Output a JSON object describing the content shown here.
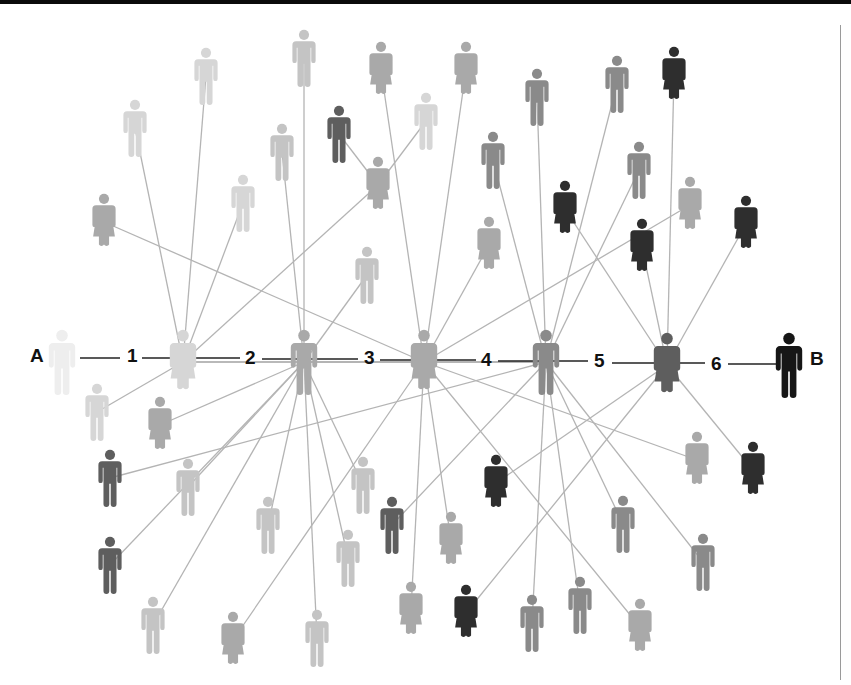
{
  "chain": {
    "start_label": "A",
    "end_label": "B",
    "steps": [
      "1",
      "2",
      "3",
      "4",
      "5",
      "6"
    ]
  },
  "colors": {
    "line": "#b4b4b4",
    "chain_line": "#222222",
    "shades": {
      "0": "#eeeeee",
      "1": "#d6d6d6",
      "2": "#c4c4c4",
      "3": "#a9a9a9",
      "4": "#8a8a8a",
      "5": "#5e5e5e",
      "6": "#2e2e2e",
      "7": "#161616"
    }
  },
  "hubs": [
    {
      "id": "A",
      "x": 62,
      "y": 362,
      "g": "m",
      "shade": "0"
    },
    {
      "id": "H1",
      "x": 183,
      "y": 362,
      "g": "f",
      "shade": "1"
    },
    {
      "id": "H2",
      "x": 304,
      "y": 362,
      "g": "m",
      "shade": "3"
    },
    {
      "id": "H3",
      "x": 424,
      "y": 362,
      "g": "f",
      "shade": "3"
    },
    {
      "id": "H4",
      "x": 546,
      "y": 362,
      "g": "m",
      "shade": "4"
    },
    {
      "id": "H5",
      "x": 667,
      "y": 365,
      "g": "f",
      "shade": "5"
    },
    {
      "id": "B",
      "x": 789,
      "y": 365,
      "g": "m",
      "shade": "7"
    }
  ],
  "people": [
    {
      "x": 206,
      "y": 76,
      "g": "m",
      "shade": "1",
      "to": "H1"
    },
    {
      "x": 135,
      "y": 128,
      "g": "m",
      "shade": "1",
      "to": "H1"
    },
    {
      "x": 104,
      "y": 222,
      "g": "f",
      "shade": "3",
      "to": "H3"
    },
    {
      "x": 243,
      "y": 203,
      "g": "m",
      "shade": "1",
      "to": "H1"
    },
    {
      "x": 304,
      "y": 58,
      "g": "m",
      "shade": "2",
      "to": "H2"
    },
    {
      "x": 282,
      "y": 152,
      "g": "m",
      "shade": "2",
      "to": "H2"
    },
    {
      "x": 339,
      "y": 134,
      "g": "m",
      "shade": "5",
      "to": "P_mid"
    },
    {
      "x": 381,
      "y": 70,
      "g": "f",
      "shade": "3",
      "to": "H3"
    },
    {
      "x": 426,
      "y": 121,
      "g": "m",
      "shade": "1",
      "to": "P_mid"
    },
    {
      "x": 466,
      "y": 70,
      "g": "f",
      "shade": "3",
      "to": "H3"
    },
    {
      "id": "P_mid",
      "x": 378,
      "y": 185,
      "g": "f",
      "shade": "3",
      "to": "H1"
    },
    {
      "x": 367,
      "y": 275,
      "g": "m",
      "shade": "2",
      "to": "H2"
    },
    {
      "x": 537,
      "y": 97,
      "g": "m",
      "shade": "4",
      "to": "H4"
    },
    {
      "x": 493,
      "y": 160,
      "g": "m",
      "shade": "4",
      "to": "H4"
    },
    {
      "x": 489,
      "y": 245,
      "g": "f",
      "shade": "3",
      "to": "H3"
    },
    {
      "x": 617,
      "y": 84,
      "g": "m",
      "shade": "4",
      "to": "H4"
    },
    {
      "x": 674,
      "y": 75,
      "g": "f",
      "shade": "6",
      "to": "H5"
    },
    {
      "x": 565,
      "y": 209,
      "g": "f",
      "shade": "6",
      "to": "H5"
    },
    {
      "x": 639,
      "y": 170,
      "g": "m",
      "shade": "4",
      "to": "H4"
    },
    {
      "x": 642,
      "y": 247,
      "g": "f",
      "shade": "6",
      "to": "H5"
    },
    {
      "x": 690,
      "y": 205,
      "g": "f",
      "shade": "3",
      "to": "H3"
    },
    {
      "x": 746,
      "y": 224,
      "g": "f",
      "shade": "6",
      "to": "H5"
    },
    {
      "x": 97,
      "y": 412,
      "g": "m",
      "shade": "1",
      "to": "H1"
    },
    {
      "x": 160,
      "y": 425,
      "g": "f",
      "shade": "3",
      "to": "H2"
    },
    {
      "x": 110,
      "y": 478,
      "g": "m",
      "shade": "5",
      "to": "H4"
    },
    {
      "x": 188,
      "y": 487,
      "g": "m",
      "shade": "2",
      "to": "H2"
    },
    {
      "x": 110,
      "y": 565,
      "g": "m",
      "shade": "5",
      "to": "H2"
    },
    {
      "x": 268,
      "y": 525,
      "g": "m",
      "shade": "2",
      "to": "H2"
    },
    {
      "x": 363,
      "y": 485,
      "g": "m",
      "shade": "2",
      "to": "H2"
    },
    {
      "x": 348,
      "y": 558,
      "g": "m",
      "shade": "2",
      "to": "H2"
    },
    {
      "x": 153,
      "y": 625,
      "g": "m",
      "shade": "2",
      "to": "H2"
    },
    {
      "x": 233,
      "y": 640,
      "g": "f",
      "shade": "3",
      "to": "H3"
    },
    {
      "x": 317,
      "y": 638,
      "g": "m",
      "shade": "2",
      "to": "H2"
    },
    {
      "x": 392,
      "y": 525,
      "g": "m",
      "shade": "5",
      "to": "H4"
    },
    {
      "x": 451,
      "y": 540,
      "g": "f",
      "shade": "3",
      "to": "H3"
    },
    {
      "x": 496,
      "y": 483,
      "g": "f",
      "shade": "6",
      "to": "H5"
    },
    {
      "x": 411,
      "y": 610,
      "g": "f",
      "shade": "3",
      "to": "H3"
    },
    {
      "x": 466,
      "y": 613,
      "g": "f",
      "shade": "6",
      "to": "H5"
    },
    {
      "x": 532,
      "y": 623,
      "g": "m",
      "shade": "4",
      "to": "H4"
    },
    {
      "x": 580,
      "y": 605,
      "g": "m",
      "shade": "4",
      "to": "H4"
    },
    {
      "x": 623,
      "y": 524,
      "g": "m",
      "shade": "4",
      "to": "H4"
    },
    {
      "x": 640,
      "y": 627,
      "g": "f",
      "shade": "3",
      "to": "H3"
    },
    {
      "x": 697,
      "y": 460,
      "g": "f",
      "shade": "3",
      "to": "H3"
    },
    {
      "x": 703,
      "y": 562,
      "g": "m",
      "shade": "4",
      "to": "H4"
    },
    {
      "x": 753,
      "y": 470,
      "g": "f",
      "shade": "6",
      "to": "H5"
    }
  ],
  "extra_links": [
    [
      "H1",
      "H4"
    ],
    [
      "H2",
      "H3"
    ],
    [
      "H3",
      "H4"
    ],
    [
      "H2",
      "H4"
    ],
    [
      "H1",
      "H3"
    ]
  ]
}
